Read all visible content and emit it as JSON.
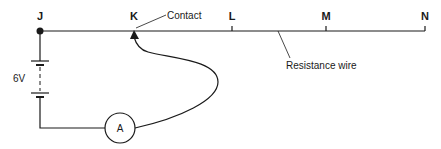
{
  "diagram": {
    "type": "circuit",
    "points": [
      {
        "id": "J",
        "label": "J"
      },
      {
        "id": "K",
        "label": "K"
      },
      {
        "id": "L",
        "label": "L"
      },
      {
        "id": "M",
        "label": "M"
      },
      {
        "id": "N",
        "label": "N"
      }
    ],
    "annotations": {
      "contact": "Contact",
      "resistance_wire": "Resistance wire"
    },
    "battery": {
      "label": "6V"
    },
    "ammeter": {
      "label": "A"
    },
    "colors": {
      "line": "#1a1a1a",
      "background": "#ffffff"
    }
  }
}
